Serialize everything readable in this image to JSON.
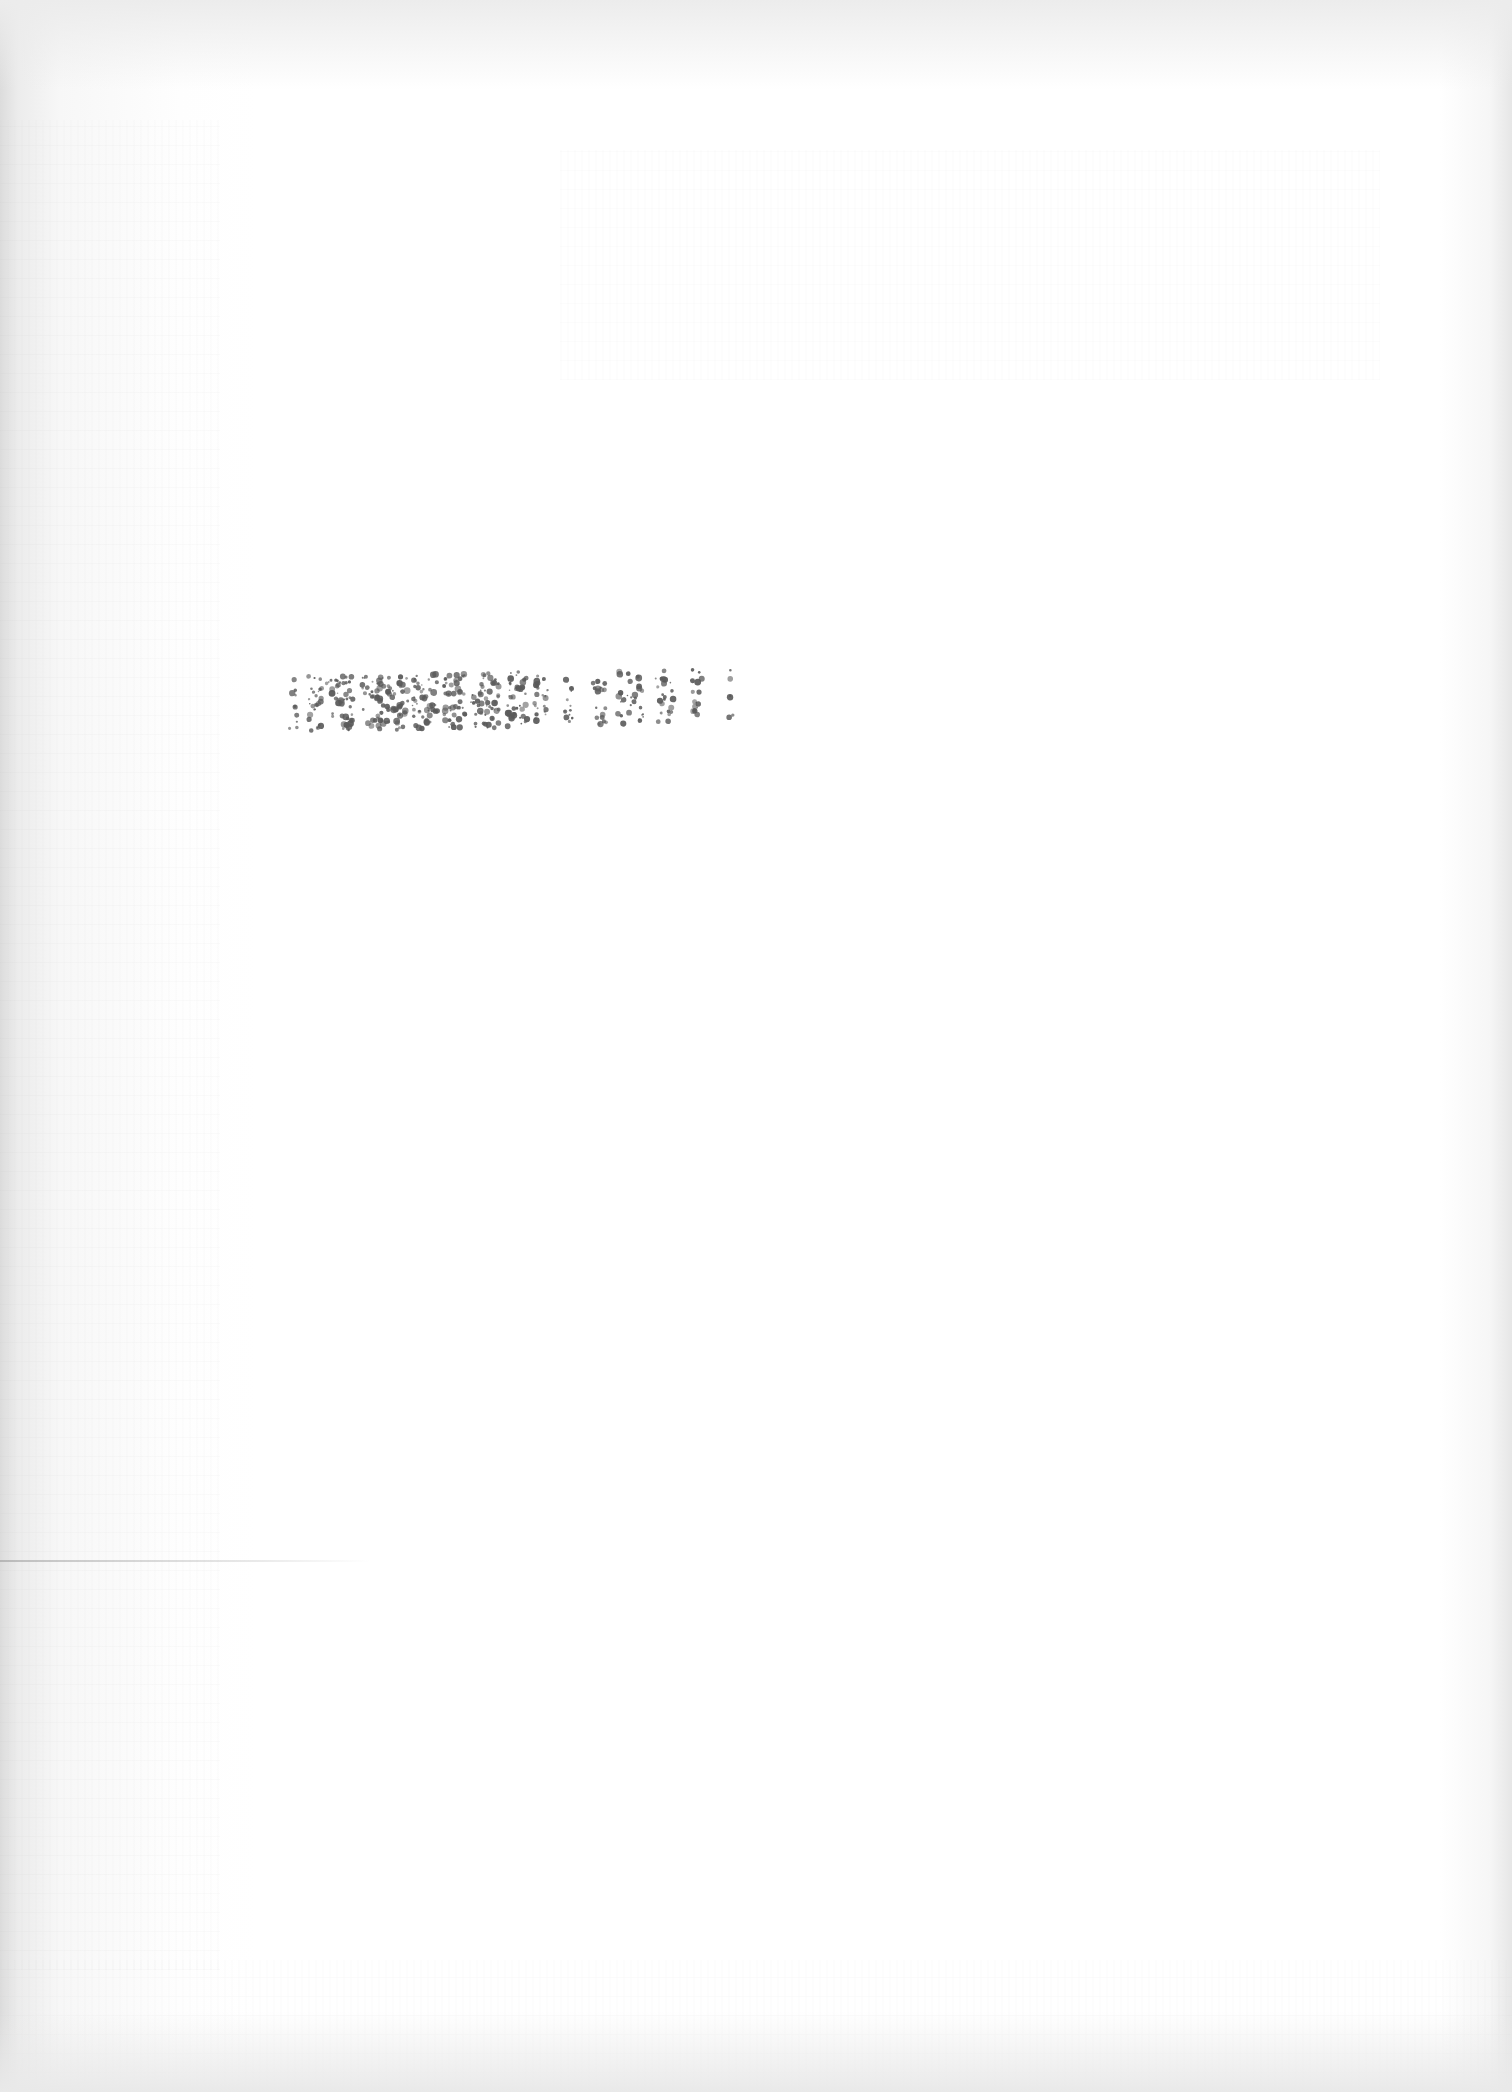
{
  "document": {
    "type": "scanned page",
    "content_state": "blank apart from a stamp",
    "background_color": "#ffffff",
    "scan_edge_color": "#dcdcdc"
  },
  "stamp": {
    "text": "[illegible stamp]",
    "legible": false,
    "ink_color": "#5a5a5a",
    "position_hint": "left-center, upper third of page"
  },
  "artifacts": {
    "fold_line": "faint horizontal rule at lower-left",
    "show_through": "faint reverse-side text bleed, unreadable"
  }
}
